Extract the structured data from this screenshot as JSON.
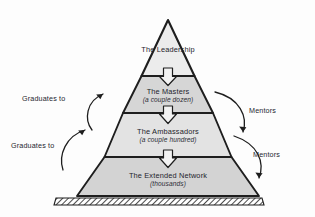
{
  "diagram": {
    "type": "pyramid-hierarchy",
    "tiers": [
      {
        "title": "The Leadership",
        "subtitle": ""
      },
      {
        "title": "The Masters",
        "subtitle": "(a couple dozen)"
      },
      {
        "title": "The Ambassadors",
        "subtitle": "(a couple hundred)"
      },
      {
        "title": "The Extended Network",
        "subtitle": "(thousands)"
      }
    ],
    "flow_arrows": [
      {
        "name": "arrow-leadership-to-masters",
        "direction": "down"
      },
      {
        "name": "arrow-masters-to-ambassadors",
        "direction": "down"
      },
      {
        "name": "arrow-ambassadors-to-network",
        "direction": "down"
      }
    ],
    "side_annotations": {
      "left": [
        {
          "label": "Graduates to",
          "direction": "upward"
        },
        {
          "label": "Graduates to",
          "direction": "upward"
        }
      ],
      "right": [
        {
          "label": "Mentors",
          "direction": "downward"
        },
        {
          "label": "Mentors",
          "direction": "downward"
        }
      ]
    },
    "colors": {
      "tier_light": "#e8e8e8",
      "tier_dark": "#d3d3d3",
      "outline": "#1e1e1e",
      "text": "#262630",
      "background": "#fdfdfd"
    }
  }
}
